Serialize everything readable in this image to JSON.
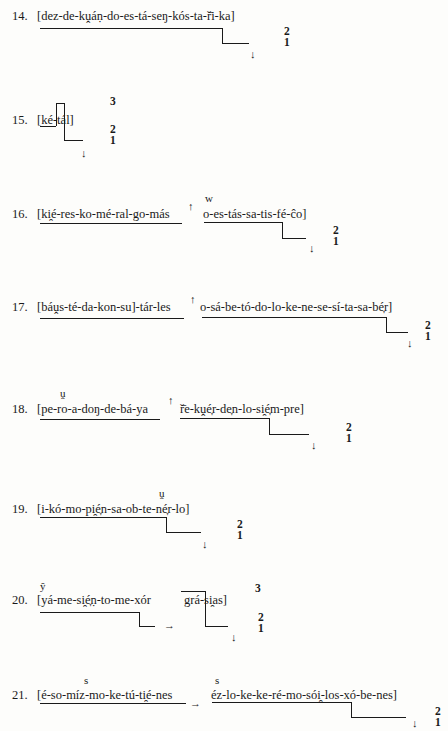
{
  "examples": [
    {
      "number": "14.",
      "text": "[dez-de-kṷáṇ-do-es-tá-seŋ-kós-ta-ř̄i-ka]",
      "levels": [
        "2",
        "1"
      ],
      "terminal": "↓"
    },
    {
      "number": "15.",
      "text": "[ké-tál]",
      "levels": [
        "3",
        "2",
        "1"
      ],
      "terminal": "↓"
    },
    {
      "number": "16.",
      "text_a": "[ki̯é-res-ko-mé-ral-go-más",
      "text_b": "o-es-tás-sa-tis-fé-ĉo]",
      "juncture": "↑",
      "superscript": "w",
      "levels": [
        "2",
        "1"
      ],
      "terminal": "↓"
    },
    {
      "number": "17.",
      "text_a": "[báṷs-té-da-kon-su]-tár-les",
      "text_b": "o-sá-be-tó-do-lo-ke-ne-se-sí-ta-sa-bé̞r]",
      "juncture": "↑",
      "levels": [
        "2",
        "1"
      ],
      "terminal": "↓"
    },
    {
      "number": "18.",
      "text_a": "[pe-ro-a-doŋ-de-bá-ya",
      "text_b": "ř̄e-kṷé̞r-de̞n-lo-si̯é̞m-pre]",
      "juncture": "↑",
      "superscript": "ṷ",
      "levels": [
        "2",
        "1"
      ],
      "terminal": "↓"
    },
    {
      "number": "19.",
      "text": "[i-kó-mo-pi̯é̞n-sa-ob-te-né̞r-lo]",
      "superscript": "ṷ",
      "levels": [
        "2",
        "1"
      ],
      "terminal": "↓"
    },
    {
      "number": "20.",
      "text_a": "[yá-me-si̯é̞ṇ-to-me-xór",
      "text_b": "grá-si̯as]",
      "juncture": "→",
      "superscript": "ŷ",
      "levels": [
        "3",
        "2",
        "1"
      ],
      "terminal": "↓"
    },
    {
      "number": "21.",
      "text_a": "[é-so-míz-mo-ke-tú-ti̯é-nes",
      "text_b": "éz-lo-ke-ke-ré-mo-sói̯-los-xó-be-nes]",
      "juncture": "→",
      "superscript": "s",
      "superscript_b": "s",
      "levels": [
        "2",
        "1"
      ],
      "terminal": "↓"
    }
  ]
}
